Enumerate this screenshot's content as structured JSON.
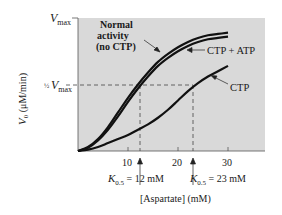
{
  "chart_data": {
    "type": "line",
    "title": "",
    "xlabel": "[Aspartate] (mM)",
    "ylabel": "V0 (μM/min)",
    "xlim": [
      0,
      37.4
    ],
    "ylim": [
      0,
      1
    ],
    "x_ticks": [
      10,
      20,
      30
    ],
    "x_tick_labels": [
      "10",
      "20",
      "30"
    ],
    "y_tick_labels": [
      "Vmax",
      "½ Vmax"
    ],
    "y_tick_values": [
      1.0,
      0.5
    ],
    "grid": false,
    "background": "#d9d9d9",
    "x": [
      0,
      2,
      4,
      6,
      8,
      10,
      12,
      14,
      16,
      18,
      20,
      22,
      24,
      26,
      28,
      30
    ],
    "series": [
      {
        "name": "Normal activity (no CTP)",
        "values": [
          0,
          0.03,
          0.09,
          0.18,
          0.29,
          0.4,
          0.5,
          0.59,
          0.67,
          0.73,
          0.78,
          0.82,
          0.85,
          0.87,
          0.88,
          0.89
        ]
      },
      {
        "name": "CTP + ATP",
        "values": [
          0,
          0.025,
          0.08,
          0.16,
          0.26,
          0.37,
          0.47,
          0.56,
          0.64,
          0.7,
          0.75,
          0.79,
          0.82,
          0.84,
          0.85,
          0.86
        ]
      },
      {
        "name": "CTP",
        "values": [
          0,
          0.01,
          0.03,
          0.06,
          0.09,
          0.12,
          0.16,
          0.2,
          0.25,
          0.31,
          0.38,
          0.45,
          0.51,
          0.56,
          0.6,
          0.64
        ]
      }
    ],
    "reference_lines": [
      {
        "type": "horizontal",
        "y": 0.5,
        "label": "½ Vmax",
        "style": "dashed"
      },
      {
        "type": "vertical",
        "x": 12,
        "label": "K0.5 = 12 mM",
        "style": "dashed"
      },
      {
        "type": "vertical",
        "x": 23,
        "label": "K0.5 = 23 mM",
        "style": "dashed"
      }
    ],
    "annotations": [
      {
        "text": "Normal activity (no CTP)",
        "arrow_to": "Normal activity curve"
      },
      {
        "text": "CTP + ATP",
        "arrow_to": "CTP + ATP curve"
      },
      {
        "text": "CTP",
        "arrow_to": "CTP curve"
      },
      {
        "text": "K0.5 = 12 mM",
        "arrow_to": "x = 12"
      },
      {
        "text": "K0.5 = 23 mM",
        "arrow_to": "x = 23"
      }
    ]
  },
  "labels": {
    "vmax_main": "V",
    "vmax_sub": "max",
    "half_frac": "½",
    "half_v": "V",
    "half_sub": "max",
    "ylabel_v": "V",
    "ylabel_sub": "0",
    "ylabel_units": " (μM/min)",
    "xlabel": "[Aspartate] (mM)",
    "normal_line1": "Normal",
    "normal_line2": "activity",
    "normal_line3": "(no CTP)",
    "ctp_atp": "CTP + ATP",
    "ctp": "CTP",
    "k1_k": "K",
    "k1_sub": "0.5",
    "k1_val": " = 12 mM",
    "k2_k": "K",
    "k2_sub": "0.5",
    "k2_val": " = 23 mM",
    "tick10": "10",
    "tick20": "20",
    "tick30": "30"
  }
}
